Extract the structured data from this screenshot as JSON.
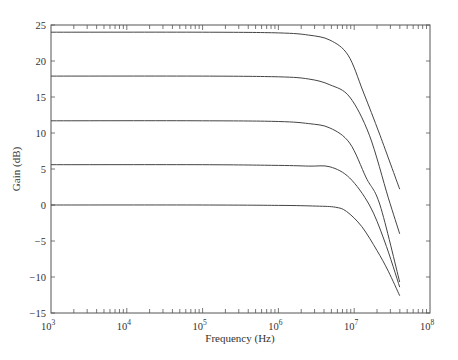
{
  "chart_data": {
    "type": "line",
    "title": "",
    "xlabel": "Frequency (Hz)",
    "ylabel": "Gain (dB)",
    "xscale": "log",
    "xlim": [
      1000,
      100000000
    ],
    "ylim": [
      -15,
      25
    ],
    "grid": false,
    "legend": null,
    "x_tick_labels": [
      {
        "base": "10",
        "exp": "3",
        "value": 1000
      },
      {
        "base": "10",
        "exp": "4",
        "value": 10000
      },
      {
        "base": "10",
        "exp": "5",
        "value": 100000
      },
      {
        "base": "10",
        "exp": "6",
        "value": 1000000
      },
      {
        "base": "10",
        "exp": "7",
        "value": 10000000
      },
      {
        "base": "10",
        "exp": "8",
        "value": 100000000
      }
    ],
    "y_tick_labels": [
      "25",
      "20",
      "15",
      "10",
      "5",
      "0",
      "−5",
      "−10",
      "−15"
    ],
    "y_ticks": [
      25,
      20,
      15,
      10,
      5,
      0,
      -5,
      -10,
      -15
    ],
    "series": [
      {
        "name": "24 dB",
        "log10_freq": [
          3.0,
          5.0,
          6.0,
          6.4,
          6.68,
          6.92,
          7.12,
          7.34,
          7.6
        ],
        "gain_db": [
          24.0,
          24.0,
          23.9,
          23.6,
          22.9,
          20.8,
          15.7,
          9.7,
          2.2
        ]
      },
      {
        "name": "18 dB",
        "log10_freq": [
          3.0,
          5.0,
          6.0,
          6.4,
          6.68,
          6.94,
          7.2,
          7.45,
          7.6
        ],
        "gain_db": [
          17.9,
          17.9,
          17.8,
          17.5,
          16.7,
          15.0,
          9.7,
          1.0,
          -4.0
        ]
      },
      {
        "name": "12 dB",
        "log10_freq": [
          3.0,
          5.0,
          6.0,
          6.4,
          6.68,
          6.94,
          7.16,
          7.34,
          7.6
        ],
        "gain_db": [
          11.7,
          11.7,
          11.6,
          11.3,
          10.7,
          8.6,
          3.75,
          0.0,
          -10.7
        ]
      },
      {
        "name": "6 dB",
        "log10_freq": [
          3.0,
          5.0,
          6.0,
          6.4,
          6.68,
          6.94,
          7.2,
          7.4,
          7.6
        ],
        "gain_db": [
          5.6,
          5.6,
          5.5,
          5.4,
          5.3,
          3.75,
          0.0,
          -5.0,
          -11.4
        ]
      },
      {
        "name": "0 dB",
        "log10_freq": [
          3.0,
          5.0,
          6.0,
          6.5,
          6.75,
          6.9,
          7.1,
          7.3,
          7.45,
          7.6
        ],
        "gain_db": [
          0.0,
          0.0,
          -0.05,
          -0.15,
          -0.3,
          -0.9,
          -3.0,
          -6.3,
          -9.2,
          -12.6
        ]
      }
    ]
  },
  "style": {
    "line_color": "#444444",
    "axis_color": "#555555"
  }
}
